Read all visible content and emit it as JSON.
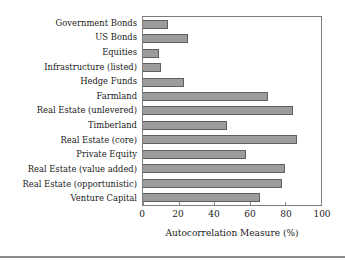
{
  "chart_data": {
    "type": "bar",
    "orientation": "horizontal",
    "title": "",
    "subtitle": "",
    "xlabel": "Autocorrelation Measure (%)",
    "ylabel": "",
    "xlim": [
      0,
      100
    ],
    "xticks": [
      0,
      20,
      40,
      60,
      80,
      100
    ],
    "xtick_labels": [
      "0",
      "20",
      "40",
      "60",
      "80",
      "100"
    ],
    "grid": false,
    "legend": null,
    "bar_color": "#9c9c9c",
    "bar_edge_color": "#5f5f5f",
    "frame_color": "#7d7d7d",
    "categories": [
      "Government Bonds",
      "US Bonds",
      "Equities",
      "Infrastructure (listed)",
      "Hedge Funds",
      "Farmland",
      "Real Estate (unlevered)",
      "Timberland",
      "Real Estate (core)",
      "Private Equity",
      "Real Estate (value added)",
      "Real Estate (opportunistic)",
      "Venture Capital"
    ],
    "values": [
      14,
      25,
      9,
      10,
      23,
      70.5,
      84,
      47,
      86.5,
      58,
      79.5,
      78,
      65.5
    ]
  }
}
